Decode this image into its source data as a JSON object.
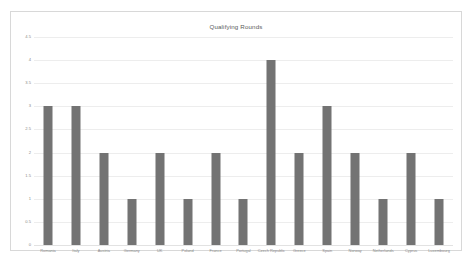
{
  "chart_data": {
    "type": "bar",
    "title": "Qualifying Rounds",
    "xlabel": "",
    "ylabel": "",
    "categories": [
      "Romania",
      "Italy",
      "Austria",
      "Germany",
      "UK",
      "Poland",
      "France",
      "Portugal",
      "Czech Republic",
      "Greece",
      "Spain",
      "Norway",
      "Netherlands",
      "Cyprus",
      "Luxembourg"
    ],
    "values": [
      3,
      3,
      2,
      1,
      2,
      1,
      2,
      1,
      4,
      2,
      3,
      2,
      1,
      2,
      1
    ],
    "ylim": [
      0,
      4.5
    ],
    "ytick_labels": [
      "0",
      "0.5",
      "1",
      "1.5",
      "2",
      "2.5",
      "3",
      "3.5",
      "4",
      "4.5"
    ],
    "ytick_values": [
      0,
      0.5,
      1,
      1.5,
      2,
      2.5,
      3,
      3.5,
      4,
      4.5
    ],
    "grid": true,
    "legend": false,
    "bar_color": "#737373",
    "gridline_color": "#ededed",
    "title_color": "#5a5a5a",
    "tick_color": "#8a8a8a",
    "plot_background": "#ffffff",
    "frame_color": "#d8d8d8"
  }
}
